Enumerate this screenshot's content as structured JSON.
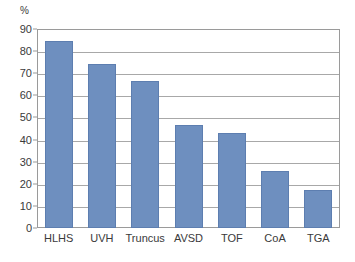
{
  "chart_data": {
    "type": "bar",
    "title": "",
    "subtitle": "",
    "xlabel": "",
    "ylabel": "%",
    "unit_label": "%",
    "categories": [
      "HLHS",
      "UVH",
      "Truncus",
      "AVSD",
      "TOF",
      "CoA",
      "TGA"
    ],
    "values": [
      84.5,
      74,
      66.5,
      46.5,
      43,
      26,
      17
    ],
    "ylim": [
      0,
      90
    ],
    "ytick_step": 10,
    "ytick_labels": [
      "90",
      "80",
      "70",
      "60",
      "50",
      "40",
      "30",
      "20",
      "10",
      "0"
    ],
    "ytick_values": [
      90,
      80,
      70,
      60,
      50,
      40,
      30,
      20,
      10,
      0
    ],
    "grid": "horizontal",
    "legend": "none",
    "series": [
      {
        "name": "",
        "values": [
          84.5,
          74,
          66.5,
          46.5,
          43,
          26,
          17
        ]
      }
    ],
    "colors": {
      "bar_fill": "#6e8fbf",
      "bar_edge": "#5d7eb0",
      "gridline": "#a8a8a8",
      "frame": "#9a9a9a",
      "text": "#3a3a3a",
      "background": "#ffffff"
    }
  }
}
